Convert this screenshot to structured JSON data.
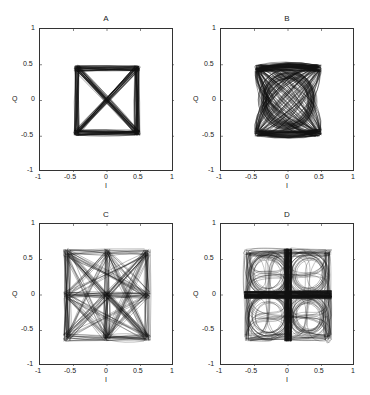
{
  "chart_data": [
    {
      "type": "scatter",
      "title": "A",
      "xlabel": "I",
      "ylabel": "Q",
      "xlim": [
        -1,
        1
      ],
      "ylim": [
        -1,
        1
      ],
      "xticks": [
        "-1",
        "-0.5",
        "0",
        "0.5",
        "1"
      ],
      "yticks": [
        "-1",
        "-0.5",
        "0",
        "0.5",
        "1"
      ],
      "grid": false,
      "description": "QPSK-like constellation trajectories: square with corners near (+/-0.45, +/-0.45) and diagonal X crossings",
      "points": [
        [
          -0.45,
          0.45
        ],
        [
          0.45,
          0.45
        ],
        [
          -0.45,
          -0.45
        ],
        [
          0.45,
          -0.45
        ]
      ],
      "shape": "square-with-diagonals"
    },
    {
      "type": "scatter",
      "title": "B",
      "xlabel": "I",
      "ylabel": "Q",
      "xlim": [
        -1,
        1
      ],
      "ylim": [
        -1,
        1
      ],
      "xticks": [
        "-1",
        "-0.5",
        "0",
        "0.5",
        "1"
      ],
      "yticks": [
        "-1",
        "-0.5",
        "0",
        "0.5",
        "1"
      ],
      "grid": false,
      "description": "Offset/filtered trajectories: square boundary near +/-0.45 with empty circular interior radius ~0.3",
      "points": [
        [
          -0.45,
          0.45
        ],
        [
          0.45,
          0.45
        ],
        [
          -0.45,
          -0.45
        ],
        [
          0.45,
          -0.45
        ]
      ],
      "shape": "square-with-circular-hole"
    },
    {
      "type": "scatter",
      "title": "C",
      "xlabel": "I",
      "ylabel": "Q",
      "xlim": [
        -1,
        1
      ],
      "ylim": [
        -1,
        1
      ],
      "xticks": [
        "-1",
        "-0.5",
        "0",
        "0.5",
        "1"
      ],
      "yticks": [
        "-1",
        "-0.5",
        "0",
        "0.5",
        "1"
      ],
      "grid": false,
      "description": "9-point constellation trajectories at {-0.6,0,0.6} x {-0.6,0,0.6} with many straight transitions",
      "points": [
        [
          -0.6,
          0.6
        ],
        [
          0,
          0.6
        ],
        [
          0.6,
          0.6
        ],
        [
          -0.6,
          0
        ],
        [
          0,
          0
        ],
        [
          0.6,
          0
        ],
        [
          -0.6,
          -0.6
        ],
        [
          0,
          -0.6
        ],
        [
          0.6,
          -0.6
        ]
      ],
      "shape": "nine-point-star"
    },
    {
      "type": "scatter",
      "title": "D",
      "xlabel": "I",
      "ylabel": "Q",
      "xlim": [
        -1,
        1
      ],
      "ylim": [
        -1,
        1
      ],
      "xticks": [
        "-1",
        "-0.5",
        "0",
        "0.5",
        "1"
      ],
      "yticks": [
        "-1",
        "-0.5",
        "0",
        "0.5",
        "1"
      ],
      "grid": false,
      "description": "9-point trajectories with curved transitions: dense cross at axes and four empty lobes in each quadrant",
      "points": [
        [
          -0.6,
          0.6
        ],
        [
          0,
          0.6
        ],
        [
          0.6,
          0.6
        ],
        [
          -0.6,
          0
        ],
        [
          0,
          0
        ],
        [
          0.6,
          0
        ],
        [
          -0.6,
          -0.6
        ],
        [
          0,
          -0.6
        ],
        [
          0.6,
          -0.6
        ]
      ],
      "shape": "cross-with-four-lobes"
    }
  ],
  "panels": [
    {
      "title": "A",
      "xlabel": "I",
      "ylabel": "Q"
    },
    {
      "title": "B",
      "xlabel": "I",
      "ylabel": "Q"
    },
    {
      "title": "C",
      "xlabel": "I",
      "ylabel": "Q"
    },
    {
      "title": "D",
      "xlabel": "I",
      "ylabel": "Q"
    }
  ],
  "ticks": [
    "-1",
    "-0.5",
    "0",
    "0.5",
    "1"
  ]
}
